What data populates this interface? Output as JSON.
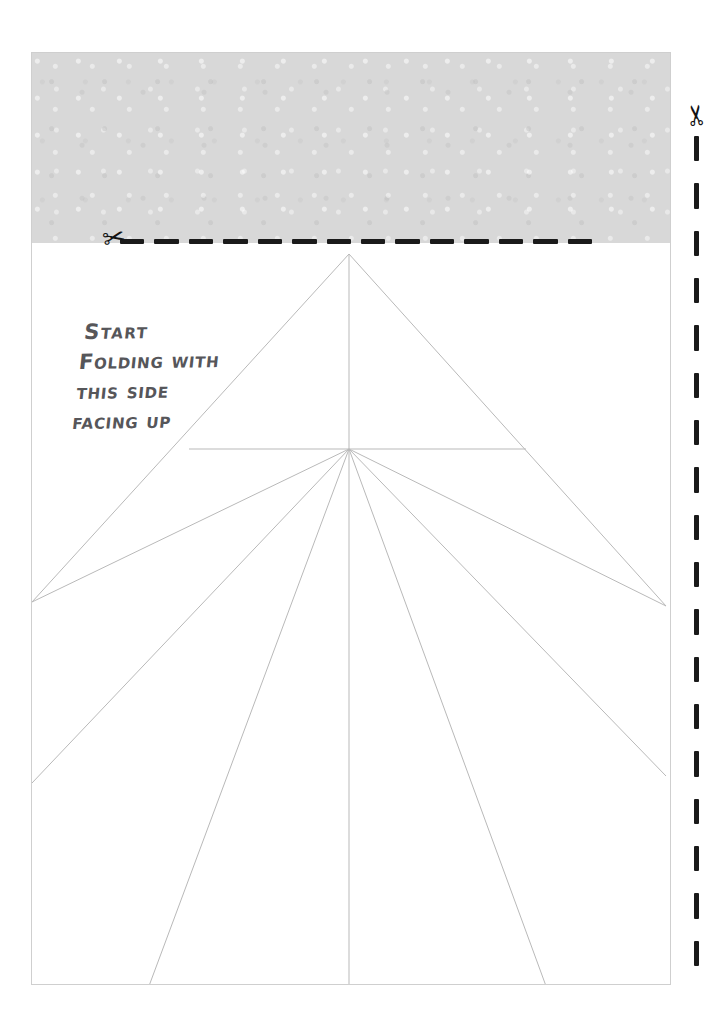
{
  "sheet": {
    "background_color": "#ffffff",
    "border_color": "#cfcfcf",
    "shaded_band_color": "#d8d8d8",
    "fold_line_color": "#b9b9b9",
    "cut_line_color": "#1a1a1a"
  },
  "instruction": {
    "lines": [
      "Start",
      "Folding with",
      "this side",
      "facing up"
    ],
    "ink_color": "#56565a"
  },
  "cut_marks": {
    "horizontal": {
      "label": "cut-here-horizontal",
      "scissors_glyph": "✂",
      "dash_count": 14
    },
    "vertical": {
      "label": "cut-here-vertical",
      "scissors_glyph": "✂",
      "dash_count": 18
    }
  },
  "fold_pattern": {
    "apex": [
      348,
      253
    ],
    "hub": [
      348,
      448
    ],
    "description": "radiating crease lines"
  }
}
